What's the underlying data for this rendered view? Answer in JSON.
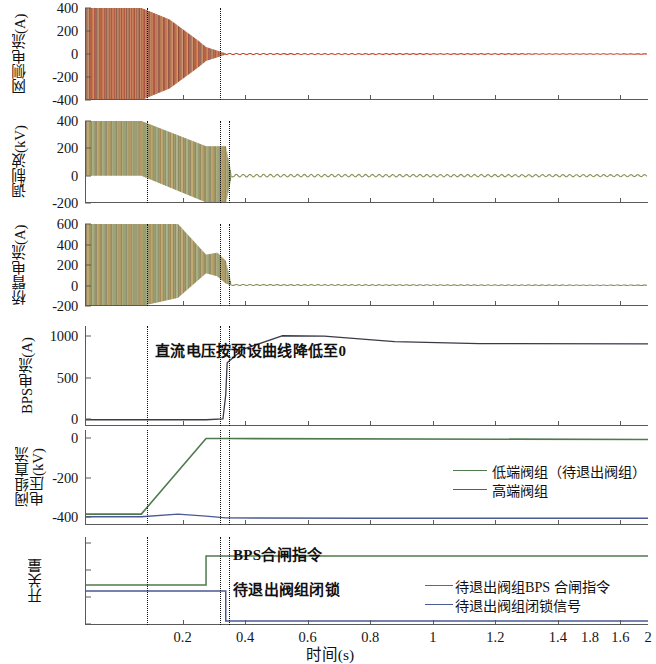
{
  "figure": {
    "xaxis": {
      "label": "时间(s)",
      "ticks": [
        "0.2",
        "0.4",
        "0.6",
        "0.8",
        "1",
        "1.2",
        "1.4",
        "1.6",
        "1.8",
        "2"
      ],
      "min": 0.0,
      "max": 2.0
    },
    "event_lines": [
      0.2,
      0.43,
      0.5
    ],
    "colors": {
      "red": "#c3452e",
      "orange": "#d47a3a",
      "olive": "#8a8f57",
      "green": "#4f7a4f",
      "blue": "#4a5a92",
      "dark": "#3a3a48",
      "axis": "#5a5a5a"
    },
    "panels": [
      {
        "id": "grid-current",
        "ylabel": "网侧电流(A)",
        "yticks": [
          "400",
          "200",
          "0",
          "-200",
          "-400"
        ],
        "ylim": [
          -400,
          400
        ]
      },
      {
        "id": "modulation-wave",
        "ylabel": "调制波(kV)",
        "yticks": [
          "400",
          "200",
          "0",
          "-200"
        ],
        "ylim": [
          -200,
          400
        ]
      },
      {
        "id": "bridge-arm-current",
        "ylabel": "桥臂电流(A)",
        "yticks": [
          "600",
          "400",
          "200",
          "0",
          "-200"
        ],
        "ylim": [
          -200,
          600
        ]
      },
      {
        "id": "bps-current",
        "ylabel": "BPS电流(A)",
        "yticks": [
          "1000",
          "500",
          "0"
        ],
        "ylim": [
          -80,
          1200
        ],
        "annotation": "直流电压按预设曲线降低至0"
      },
      {
        "id": "valve-group-dc-voltage",
        "ylabel_line1": "阀组直流",
        "ylabel_line2": "电压(kV)",
        "yticks": [
          "0",
          "-200",
          "-400"
        ],
        "ylim": [
          -440,
          40
        ],
        "legend": [
          {
            "label": "低端阀组（待退出阀组）",
            "color": "#4f7a4f"
          },
          {
            "label": "高端阀组",
            "color": "#4a5a92"
          }
        ]
      },
      {
        "id": "switching-signals",
        "ylabel": "开关量",
        "yticks": [
          "",
          "",
          "",
          ""
        ],
        "annotations": [
          "BPS合闸指令",
          "待退出阀组闭锁"
        ],
        "legend": [
          {
            "label": "待退出阀组BPS 合闸指令",
            "color": "#4f7a4f"
          },
          {
            "label": "待退出阀组闭锁信号",
            "color": "#4a5a92"
          }
        ]
      }
    ]
  },
  "chart_data": {
    "type": "line",
    "title": "",
    "xlabel": "时间(s)",
    "x": [
      0.0,
      0.2,
      0.43,
      0.5,
      0.7,
      1.0,
      1.4,
      2.0
    ],
    "series": [
      {
        "name": "网侧电流(A)",
        "panel": "grid-current",
        "ylabel": "网侧电流(A)",
        "ylim": [
          -400,
          400
        ],
        "yticks": [
          400,
          200,
          0,
          -200,
          -400
        ],
        "envelope": [
          {
            "t": 0.0,
            "min": -400,
            "max": 400
          },
          {
            "t": 0.2,
            "min": -400,
            "max": 400
          },
          {
            "t": 0.3,
            "min": -300,
            "max": 300
          },
          {
            "t": 0.4,
            "min": -120,
            "max": 120
          },
          {
            "t": 0.43,
            "min": -60,
            "max": 60
          },
          {
            "t": 0.5,
            "min": -5,
            "max": 5
          },
          {
            "t": 2.0,
            "min": -2,
            "max": 2
          }
        ],
        "color": "#c3452e"
      },
      {
        "name": "调制波(kV)",
        "panel": "modulation-wave",
        "ylabel": "调制波(kV)",
        "ylim": [
          -200,
          400
        ],
        "yticks": [
          400,
          200,
          0,
          -200
        ],
        "envelope": [
          {
            "t": 0.0,
            "min": 0,
            "max": 400
          },
          {
            "t": 0.2,
            "min": 0,
            "max": 400
          },
          {
            "t": 0.43,
            "min": -195,
            "max": 215
          },
          {
            "t": 0.5,
            "min": -205,
            "max": 215
          },
          {
            "t": 0.52,
            "min": -10,
            "max": 10
          },
          {
            "t": 2.0,
            "min": -8,
            "max": 8
          }
        ],
        "color": "#8a8f57"
      },
      {
        "name": "桥臂电流(A)",
        "panel": "bridge-arm-current",
        "ylabel": "桥臂电流(A)",
        "ylim": [
          -200,
          600
        ],
        "yticks": [
          600,
          400,
          200,
          0,
          -200
        ],
        "envelope": [
          {
            "t": 0.0,
            "min": -200,
            "max": 660
          },
          {
            "t": 0.2,
            "min": -200,
            "max": 665
          },
          {
            "t": 0.33,
            "min": -120,
            "max": 600
          },
          {
            "t": 0.43,
            "min": 120,
            "max": 300
          },
          {
            "t": 0.47,
            "min": 90,
            "max": 320
          },
          {
            "t": 0.5,
            "min": 20,
            "max": 240
          },
          {
            "t": 0.52,
            "min": 0,
            "max": 10
          },
          {
            "t": 2.0,
            "min": 0,
            "max": 5
          }
        ],
        "color": "#8a8f57"
      },
      {
        "name": "BPS电流(A)",
        "panel": "bps-current",
        "ylabel": "BPS电流(A)",
        "ylim": [
          -80,
          1200
        ],
        "yticks": [
          1000,
          500,
          0
        ],
        "points": [
          {
            "t": 0.0,
            "v": 0
          },
          {
            "t": 0.2,
            "v": 0
          },
          {
            "t": 0.43,
            "v": 0
          },
          {
            "t": 0.49,
            "v": 10
          },
          {
            "t": 0.5,
            "v": 320
          },
          {
            "t": 0.505,
            "v": 730
          },
          {
            "t": 0.56,
            "v": 900
          },
          {
            "t": 0.7,
            "v": 1075
          },
          {
            "t": 0.85,
            "v": 1070
          },
          {
            "t": 1.1,
            "v": 1000
          },
          {
            "t": 1.4,
            "v": 975
          },
          {
            "t": 2.0,
            "v": 970
          }
        ],
        "color": "#3a3a48"
      },
      {
        "name": "低端阀组（待退出阀组）",
        "panel": "valve-group-dc-voltage",
        "ylabel": "阀组直流电压(kV)",
        "ylim": [
          -440,
          40
        ],
        "yticks": [
          0,
          -200,
          -400
        ],
        "points": [
          {
            "t": 0.0,
            "v": -385
          },
          {
            "t": 0.2,
            "v": -385
          },
          {
            "t": 0.43,
            "v": -3
          },
          {
            "t": 0.5,
            "v": -3
          },
          {
            "t": 2.0,
            "v": -8
          }
        ],
        "color": "#4f7a4f"
      },
      {
        "name": "高端阀组",
        "panel": "valve-group-dc-voltage",
        "ylim": [
          -440,
          40
        ],
        "points": [
          {
            "t": 0.0,
            "v": -398
          },
          {
            "t": 0.2,
            "v": -398
          },
          {
            "t": 0.33,
            "v": -385
          },
          {
            "t": 0.43,
            "v": -395
          },
          {
            "t": 0.5,
            "v": -404
          },
          {
            "t": 1.0,
            "v": -406
          },
          {
            "t": 2.0,
            "v": -406
          }
        ],
        "color": "#4a5a92"
      },
      {
        "name": "待退出阀组BPS 合闸指令",
        "panel": "switching-signals",
        "ylabel": "开关量",
        "points": [
          {
            "t": 0.0,
            "v": 0
          },
          {
            "t": 0.43,
            "v": 0
          },
          {
            "t": 0.43,
            "v": 1
          },
          {
            "t": 2.0,
            "v": 1
          }
        ],
        "color": "#4f7a4f"
      },
      {
        "name": "待退出阀组闭锁信号",
        "panel": "switching-signals",
        "points": [
          {
            "t": 0.0,
            "v": 1
          },
          {
            "t": 0.5,
            "v": 1
          },
          {
            "t": 0.5,
            "v": 0
          },
          {
            "t": 2.0,
            "v": 0
          }
        ],
        "color": "#4a5a92"
      }
    ],
    "annotations": [
      {
        "text": "直流电压按预设曲线降低至0",
        "panel": "bps-current"
      },
      {
        "text": "BPS合闸指令",
        "panel": "switching-signals"
      },
      {
        "text": "待退出阀组闭锁",
        "panel": "switching-signals"
      }
    ],
    "event_lines": [
      0.2,
      0.43,
      0.5
    ],
    "grid": false,
    "legend_position": "right"
  }
}
